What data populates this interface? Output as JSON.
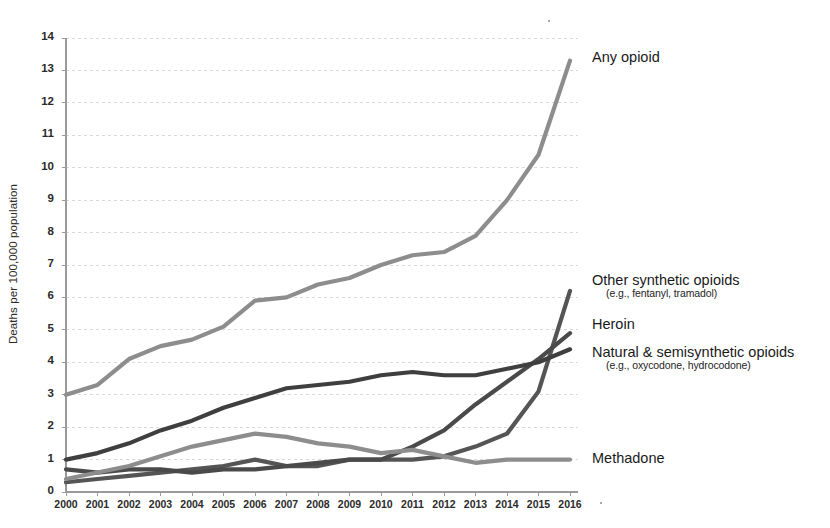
{
  "chart_data": {
    "type": "line",
    "title": "",
    "xlabel": "",
    "ylabel": "Deaths per 100,000 population",
    "xlim": [
      2000,
      2016
    ],
    "ylim": [
      0,
      14
    ],
    "yticks": [
      0,
      1,
      2,
      3,
      4,
      5,
      6,
      7,
      8,
      9,
      10,
      11,
      12,
      13,
      14
    ],
    "grid": true,
    "legend_position": "right-inline-labels",
    "categories": [
      2000,
      2001,
      2002,
      2003,
      2004,
      2005,
      2006,
      2007,
      2008,
      2009,
      2010,
      2011,
      2012,
      2013,
      2014,
      2015,
      2016
    ],
    "series": [
      {
        "name": "Any opioid",
        "label": "Any opioid",
        "sublabel": "",
        "color": "#8d8d8d",
        "values": [
          3.0,
          3.3,
          4.1,
          4.5,
          4.7,
          5.1,
          5.9,
          6.0,
          6.4,
          6.6,
          7.0,
          7.3,
          7.4,
          7.9,
          9.0,
          10.4,
          13.3
        ]
      },
      {
        "name": "Other synthetic opioids",
        "label": "Other synthetic opioids",
        "sublabel": "(e.g., fentanyl, tramadol)",
        "color": "#555555",
        "values": [
          0.3,
          0.4,
          0.5,
          0.6,
          0.7,
          0.8,
          1.0,
          0.8,
          0.8,
          1.0,
          1.0,
          1.0,
          1.1,
          1.4,
          1.8,
          3.1,
          6.2
        ]
      },
      {
        "name": "Heroin",
        "label": "Heroin",
        "sublabel": "",
        "color": "#4a4a4a",
        "values": [
          0.7,
          0.6,
          0.7,
          0.7,
          0.6,
          0.7,
          0.7,
          0.8,
          0.9,
          1.0,
          1.0,
          1.4,
          1.9,
          2.7,
          3.4,
          4.1,
          4.9
        ]
      },
      {
        "name": "Natural & semisynthetic opioids",
        "label": "Natural & semisynthetic opioids",
        "sublabel": "(e.g., oxycodone, hydrocodone)",
        "color": "#3f3f3f",
        "values": [
          1.0,
          1.2,
          1.5,
          1.9,
          2.2,
          2.6,
          2.9,
          3.2,
          3.3,
          3.4,
          3.6,
          3.7,
          3.6,
          3.6,
          3.8,
          4.0,
          4.4
        ]
      },
      {
        "name": "Methadone",
        "label": "Methadone",
        "sublabel": "",
        "color": "#8d8d8d",
        "values": [
          0.4,
          0.6,
          0.8,
          1.1,
          1.4,
          1.6,
          1.8,
          1.7,
          1.5,
          1.4,
          1.2,
          1.3,
          1.1,
          0.9,
          1.0,
          1.0,
          1.0
        ]
      }
    ]
  },
  "axis": {
    "y_tick_labels": [
      "14",
      "13",
      "12",
      "11",
      "10",
      "9",
      "8",
      "7",
      "6",
      "5",
      "4",
      "3",
      "2",
      "1",
      "0"
    ],
    "x_tick_labels": [
      "2000",
      "2001",
      "2002",
      "2003",
      "2004",
      "2005",
      "2006",
      "2007",
      "2008",
      "2009",
      "2010",
      "2011",
      "2012",
      "2013",
      "2014",
      "2015",
      "2016"
    ]
  },
  "labels": {
    "any_opioid": "Any opioid",
    "other_synthetic": "Other synthetic opioids",
    "other_synthetic_sub": "(e.g., fentanyl, tramadol)",
    "heroin": "Heroin",
    "natural_semisynthetic": "Natural & semisynthetic opioids",
    "natural_semisynthetic_sub": "(e.g., oxycodone, hydrocodone)",
    "methadone": "Methadone"
  },
  "style": {
    "grid_color": "#d9d9d9",
    "axis_color": "#9a9a9a",
    "background": "#ffffff"
  }
}
